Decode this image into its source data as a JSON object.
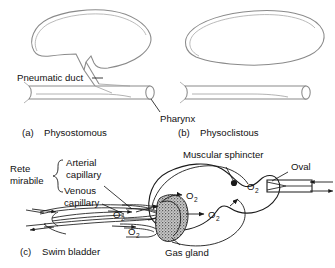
{
  "figure": {
    "panels": [
      {
        "id": "a",
        "caption_prefix": "(a)",
        "caption": "Physostomous"
      },
      {
        "id": "b",
        "caption_prefix": "(b)",
        "caption": "Physoclistous"
      },
      {
        "id": "c",
        "caption_prefix": "(c)",
        "caption": "Swim bladder"
      }
    ]
  },
  "panel_a": {
    "label_pneumatic_duct": "Pneumatic duct",
    "label_pharynx": "Pharynx",
    "caption_prefix": "(a)",
    "caption": "Physostomous"
  },
  "panel_b": {
    "caption_prefix": "(b)",
    "caption": "Physoclistous"
  },
  "panel_c": {
    "caption_prefix": "(c)",
    "caption": "Swim bladder",
    "label_rete_line1": "Rete",
    "label_rete_line2": "mirabile",
    "label_arterial_line1": "Arterial",
    "label_arterial_line2": "capillary",
    "label_venous_line1": "Venous",
    "label_venous_line2": "capillary",
    "label_muscular_sphincter": "Muscular sphincter",
    "label_oval": "Oval",
    "label_gas_gland": "Gas gland",
    "oxygen_symbol": "O",
    "oxygen_subscript": "2",
    "oxygen_labels": [
      {
        "id": "o2-rete-upper",
        "x": 113,
        "y": 214
      },
      {
        "id": "o2-rete-lower",
        "x": 128,
        "y": 231
      },
      {
        "id": "o2-gland-upper",
        "x": 186,
        "y": 196
      },
      {
        "id": "o2-gland-lower",
        "x": 210,
        "y": 214
      },
      {
        "id": "o2-oval",
        "x": 249,
        "y": 186
      }
    ]
  },
  "colors": {
    "background": "#ffffff",
    "ink": "#1a1a1a",
    "organ_gray": "#8a8a8a",
    "gland_fill": "#b9b9b9"
  }
}
